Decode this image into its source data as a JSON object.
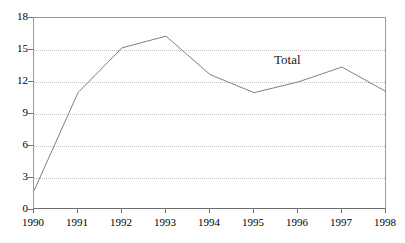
{
  "chart_data": {
    "type": "line",
    "title": "",
    "xlabel": "",
    "ylabel": "",
    "categories": [
      "1990",
      "1991",
      "1992",
      "1993",
      "1994",
      "1995",
      "1996",
      "1997",
      "1998"
    ],
    "series": [
      {
        "name": "Total",
        "values": [
          1.8,
          11.0,
          15.2,
          16.3,
          12.7,
          11.0,
          12.0,
          13.4,
          11.1
        ],
        "color": "#808080"
      }
    ],
    "ylim": [
      0,
      18
    ],
    "yticks": [
      0,
      3,
      6,
      9,
      12,
      15,
      18
    ],
    "ytick_labels": [
      "0",
      "3",
      "6",
      "9",
      "12",
      "15",
      "18"
    ],
    "xtick_labels": [
      "1990",
      "1991",
      "1992",
      "1993",
      "1994",
      "1995",
      "1996",
      "1997",
      "1998"
    ],
    "grid": {
      "horizontal": true,
      "vertical": false,
      "style": "dotted",
      "color": "#c2c2c2"
    },
    "legend": {
      "position": "inline-annotation",
      "entries": [
        "Total"
      ]
    },
    "annotations": [
      {
        "text": "Total",
        "series": "Total"
      }
    ],
    "frame_color": "#9a9a9a",
    "axis_color": "#6e6e6e",
    "background": "#ffffff"
  }
}
